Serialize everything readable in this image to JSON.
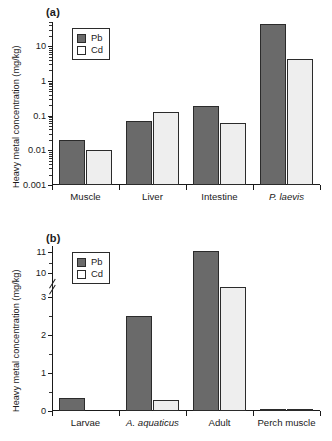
{
  "figure": {
    "ylabel": "Heavy metal concentration (mg/kg)",
    "legend": {
      "pb": "Pb",
      "cd": "Cd"
    },
    "colors": {
      "pb": "#6a6a6a",
      "cd": "#eeeeee",
      "outline": "#2b2b2b"
    }
  },
  "chart_data": [
    {
      "type": "bar",
      "panel": "(a)",
      "title": "",
      "xlabel": "",
      "ylabel": "Heavy metal concentration (mg/kg)",
      "yscale": "log",
      "ylim": [
        0.001,
        50
      ],
      "yticks": [
        0.001,
        0.01,
        0.1,
        1,
        10
      ],
      "yticklabels": [
        "0.001",
        "0.01",
        "0.1",
        "1",
        "10"
      ],
      "grid": false,
      "legend_position": "upper-left",
      "categories": [
        "Muscle",
        "Liver",
        "Intestine",
        "P. laevis"
      ],
      "categories_italic": [
        false,
        false,
        false,
        true
      ],
      "series": [
        {
          "name": "Pb",
          "values": [
            0.02,
            0.07,
            0.19,
            45
          ]
        },
        {
          "name": "Cd",
          "values": [
            0.0099,
            0.13,
            0.062,
            4.3
          ]
        }
      ]
    },
    {
      "type": "bar",
      "panel": "(b)",
      "title": "",
      "xlabel": "",
      "ylabel": "Heavy metal concentration (mg/kg)",
      "yscale": "linear-broken",
      "ylim": [
        0,
        11.3
      ],
      "axis_break": [
        3.2,
        9.8
      ],
      "yticks": [
        0,
        1,
        2,
        3,
        10,
        11
      ],
      "yticklabels": [
        "0",
        "1",
        "2",
        "3",
        "10",
        "11"
      ],
      "grid": false,
      "legend_position": "upper-left",
      "categories": [
        "Larvae",
        "A. aquaticus",
        "Adult",
        "Perch muscle"
      ],
      "categories_italic": [
        false,
        true,
        false,
        false
      ],
      "series": [
        {
          "name": "Pb",
          "values": [
            0.35,
            2.5,
            11.05,
            0.02
          ]
        },
        {
          "name": "Cd",
          "values": [
            0,
            0.3,
            3.55,
            0.02
          ]
        }
      ]
    }
  ]
}
